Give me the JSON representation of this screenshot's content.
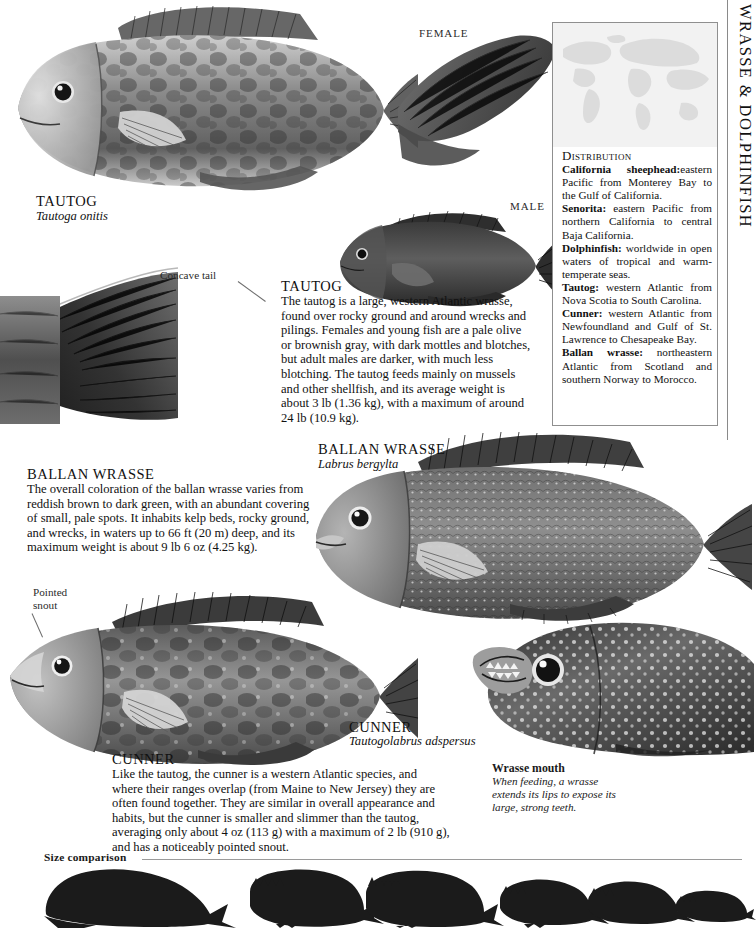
{
  "page": {
    "running_head": "WRASSE & DOLPHINFISH",
    "size_comparison_label": "Size comparison"
  },
  "distribution": {
    "title": "Distribution",
    "entries": [
      {
        "species": "California sheephead:",
        "range": "eastern Pacific from Monterey Bay to the Gulf of California."
      },
      {
        "species": "Senorita:",
        "range": "eastern Pacific from northern California to central Baja California."
      },
      {
        "species": "Dolphinfish:",
        "range": "worldwide in open waters of tropical and warm-temperate seas."
      },
      {
        "species": "Tautog:",
        "range": "western Atlantic from Nova Scotia to South Carolina."
      },
      {
        "species": "Cunner:",
        "range": "western Atlantic from Newfoundland and Gulf of St. Lawrence to Chesapeake Bay."
      },
      {
        "species": "Ballan wrasse:",
        "range": "northeastern Atlantic from Scotland and southern Norway to Morocco."
      }
    ]
  },
  "labels": {
    "female": "FEMALE",
    "male": "MALE",
    "concave_tail": "Concave tail",
    "pointed_snout": "Pointed\nsnout"
  },
  "tautog_caption": {
    "common_name": "TAUTOG",
    "latin_name": "Tautoga onitis"
  },
  "ballan_caption": {
    "common_name": "BALLAN WRASSE",
    "latin_name": "Labrus bergylta"
  },
  "cunner_caption": {
    "common_name": "CUNNER",
    "latin_name": "Tautogolabrus adspersus"
  },
  "tautog_text": {
    "heading": "TAUTOG",
    "body": "The tautog is a large, western Atlantic wrasse, found over rocky ground and around wrecks and pilings. Females and young fish are a pale olive or brownish gray, with dark mottles and blotches, but adult males are darker, with much less blotching. The tautog feeds mainly on mussels and other shellfish, and its average weight is about 3 lb (1.36 kg), with a maximum of around 24 lb (10.9 kg)."
  },
  "ballan_text": {
    "heading": "BALLAN WRASSE",
    "body": "The overall coloration of the ballan wrasse varies from reddish brown to dark green, with an abundant covering of small, pale spots. It inhabits kelp beds, rocky ground, and wrecks, in waters up to 66 ft (20 m) deep, and its maximum weight is about 9 lb 6 oz (4.25 kg)."
  },
  "cunner_text": {
    "heading": "CUNNER",
    "body": "Like the tautog, the cunner is a western Atlantic species, and where their ranges overlap (from Maine to New Jersey) they are often found together. They are similar in overall appearance and habits, but the cunner is smaller and slimmer than the tautog, averaging only about 4 oz (113 g) with a maximum of 2 lb (910 g), and has a noticeably pointed snout."
  },
  "wrasse_mouth": {
    "title": "Wrasse mouth",
    "caption": "When feeding, a wrasse extends its lips to expose its large, strong teeth."
  },
  "colors": {
    "ink": "#111111",
    "rule": "#8f8f8f",
    "map_bg": "#f2f2f2",
    "silhouette": "#1b1b1b"
  },
  "size_comparison": {
    "count": 6,
    "species_order": [
      "dolphinfish",
      "california-sheephead",
      "ballan-wrasse",
      "tautog",
      "cunner",
      "senorita"
    ]
  }
}
